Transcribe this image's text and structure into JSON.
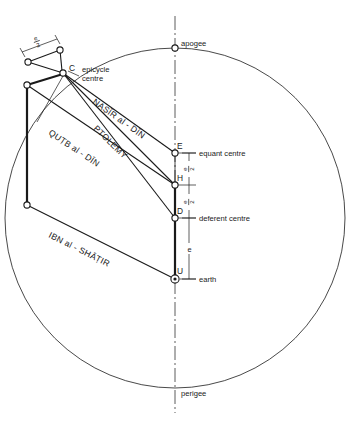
{
  "figure": {
    "type": "geometric-astronomy-diagram"
  },
  "labels": {
    "apogee": "apogee",
    "perigee": "perigee",
    "epicycle_centre_line1": "epicycle",
    "epicycle_centre_line2": "centre",
    "equant_centre": "equant centre",
    "deferent_centre": "deferent centre",
    "earth": "earth"
  },
  "points": {
    "C": "C",
    "E": "E",
    "H": "H",
    "D": "D",
    "U": "U"
  },
  "models": {
    "ptolemy": "PTOLEMY",
    "nasir_al_din": "NAṢĪR al - DĪN",
    "qutb_al_din": "QUṬB al - DĪN",
    "ibn_al_shatir": "IBN al - SHĀṬIR"
  },
  "dimensions": {
    "e": "e",
    "half_e_numerator": "e",
    "half_e_denominator": "2",
    "half_e": "e/2",
    "top_half_e": "e/2",
    "eh_segment": "e/2",
    "hd_segment": "e/2",
    "du_segment": "e"
  },
  "colors": {
    "ink": "#1a1a1a",
    "axis": "#333333",
    "background": "#ffffff"
  },
  "geometry": {
    "deferent_circle": {
      "cx": 175,
      "cy": 218,
      "r": 170
    },
    "axis_x": 175,
    "apogee_point": {
      "x": 175,
      "y": 48
    },
    "perigee_point": {
      "x": 175,
      "y": 388
    },
    "equant_E": {
      "x": 175,
      "y": 153
    },
    "point_H": {
      "x": 175,
      "y": 185
    },
    "deferent_D": {
      "x": 175,
      "y": 218
    },
    "earth_U": {
      "x": 175,
      "y": 279
    },
    "epicycle_C": {
      "x": 63,
      "y": 73
    },
    "node_top": {
      "x": 60,
      "y": 50
    },
    "node_upper_left": {
      "x": 28,
      "y": 62
    },
    "node_left_mid": {
      "x": 27,
      "y": 85
    },
    "node_left_low": {
      "x": 27,
      "y": 205
    }
  }
}
